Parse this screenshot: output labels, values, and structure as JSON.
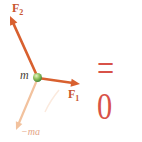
{
  "figure": {
    "description_labels": {
      "f2": {
        "base": "F",
        "sub": "2",
        "color": "#c8552f"
      },
      "f1": {
        "base": "F",
        "sub": "1",
        "color": "#c8552f"
      },
      "m": {
        "text": "m",
        "color": "#4a3f38"
      },
      "ma": {
        "text": "−ma",
        "color": "#e5a586"
      }
    },
    "equation": {
      "text": "= 0",
      "color": "#d85248"
    },
    "diagram": {
      "background": "#ffffff",
      "mass_dot": {
        "cx": 37.5,
        "cy": 77.5,
        "r": 4.5,
        "color": "#4c8a39"
      },
      "vectors": [
        {
          "name": "fictitious-force-ma",
          "x1": 37,
          "y1": 80,
          "x2": 16,
          "y2": 130,
          "color": "#f2c29e",
          "width": 2.2,
          "head_len": 8,
          "head_w": 3.5
        },
        {
          "name": "force-f2",
          "x1": 38,
          "y1": 78,
          "x2": 10,
          "y2": 16,
          "color": "#d8602f",
          "width": 2.6,
          "head_len": 9,
          "head_w": 4
        },
        {
          "name": "force-f1",
          "x1": 38,
          "y1": 78,
          "x2": 80,
          "y2": 84,
          "color": "#d8602f",
          "width": 2.6,
          "head_len": 9,
          "head_w": 4
        }
      ],
      "ghost_curve": {
        "name": "faded-reflection-streak",
        "d": "M59,90 Q50,101 45,112",
        "color": "#fbeade",
        "width": 1.5
      }
    }
  }
}
